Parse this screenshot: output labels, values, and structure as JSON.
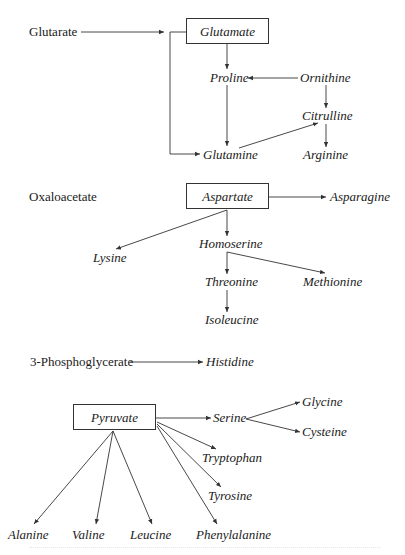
{
  "diagram": {
    "line_color": "#333333",
    "text_color": "#1a1a1a",
    "groups": [
      {
        "id": "glutarate-group",
        "precursor": "Glutarate",
        "hub": "Glutamate",
        "products": [
          "Proline",
          "Ornithine",
          "Citrulline",
          "Glutamine",
          "Arginine"
        ]
      },
      {
        "id": "oxaloacetate-group",
        "precursor": "Oxaloacetate",
        "hub": "Aspartate",
        "products": [
          "Asparagine",
          "Lysine",
          "Homoserine",
          "Threonine",
          "Methionine",
          "Isoleucine"
        ]
      },
      {
        "id": "phosphoglycerate-group",
        "precursor": "3-Phosphoglycerate",
        "products": [
          "Histidine"
        ]
      },
      {
        "id": "pyruvate-group",
        "hub": "Pyruvate",
        "products": [
          "Serine",
          "Glycine",
          "Cysteine",
          "Tryptophan",
          "Tyrosine",
          "Alanine",
          "Valine",
          "Leucine",
          "Phenylalanine"
        ]
      }
    ],
    "edges": [
      [
        "Glutarate",
        "Glutamate"
      ],
      [
        "Glutamate",
        "Proline"
      ],
      [
        "Glutamate",
        "Glutamine"
      ],
      [
        "Ornithine",
        "Proline"
      ],
      [
        "Ornithine",
        "Citrulline"
      ],
      [
        "Proline",
        "Glutamine"
      ],
      [
        "Glutamine",
        "Citrulline"
      ],
      [
        "Citrulline",
        "Arginine"
      ],
      [
        "Aspartate",
        "Asparagine"
      ],
      [
        "Aspartate",
        "Lysine"
      ],
      [
        "Aspartate",
        "Homoserine"
      ],
      [
        "Homoserine",
        "Threonine"
      ],
      [
        "Homoserine",
        "Methionine"
      ],
      [
        "Threonine",
        "Isoleucine"
      ],
      [
        "3-Phosphoglycerate",
        "Histidine"
      ],
      [
        "Pyruvate",
        "Serine"
      ],
      [
        "Serine",
        "Glycine"
      ],
      [
        "Serine",
        "Cysteine"
      ],
      [
        "Pyruvate",
        "Tryptophan"
      ],
      [
        "Pyruvate",
        "Tyrosine"
      ],
      [
        "Pyruvate",
        "Phenylalanine"
      ],
      [
        "Pyruvate",
        "Alanine"
      ],
      [
        "Pyruvate",
        "Valine"
      ],
      [
        "Pyruvate",
        "Leucine"
      ]
    ]
  },
  "labels": {
    "glutarate": "Glutarate",
    "glutamate": "Glutamate",
    "proline": "Proline",
    "ornithine": "Ornithine",
    "citrulline": "Citrulline",
    "glutamine": "Glutamine",
    "arginine": "Arginine",
    "oxaloacetate": "Oxaloacetate",
    "aspartate": "Aspartate",
    "asparagine": "Asparagine",
    "lysine": "Lysine",
    "homoserine": "Homoserine",
    "threonine": "Threonine",
    "methionine": "Methionine",
    "isoleucine": "Isoleucine",
    "phosphoglycerate": "3-Phosphoglycerate",
    "histidine": "Histidine",
    "pyruvate": "Pyruvate",
    "serine": "Serine",
    "glycine": "Glycine",
    "cysteine": "Cysteine",
    "tryptophan": "Tryptophan",
    "tyrosine": "Tyrosine",
    "alanine": "Alanine",
    "valine": "Valine",
    "leucine": "Leucine",
    "phenylalanine": "Phenylalanine"
  }
}
